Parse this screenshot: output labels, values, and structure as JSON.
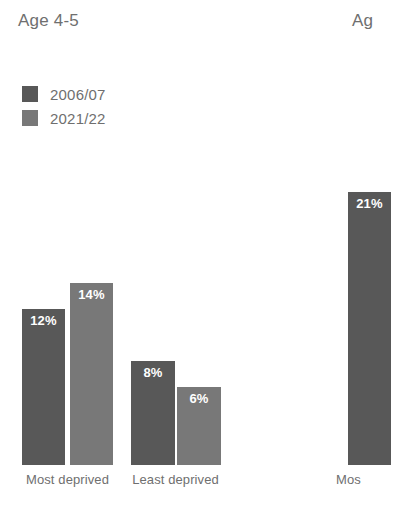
{
  "background_color": "#ffffff",
  "colors": {
    "series_2006": "#585858",
    "series_2021": "#787878",
    "text_gray": "#6f6f6f",
    "value_label": "#ffffff"
  },
  "panels": {
    "left": {
      "title": "Age 4-5",
      "legend": [
        {
          "label": "2006/07",
          "color": "#585858"
        },
        {
          "label": "2021/22",
          "color": "#787878"
        }
      ],
      "categories": [
        "Most deprived",
        "Least deprived"
      ],
      "bars": [
        {
          "category": "Most deprived",
          "series": "2006/07",
          "value": 12,
          "label": "12%"
        },
        {
          "category": "Most deprived",
          "series": "2021/22",
          "value": 14,
          "label": "14%"
        },
        {
          "category": "Least deprived",
          "series": "2006/07",
          "value": 8,
          "label": "8%"
        },
        {
          "category": "Least deprived",
          "series": "2021/22",
          "value": 6,
          "label": "6%"
        }
      ]
    },
    "right": {
      "title": "Ag",
      "categories": [
        "Mos"
      ],
      "bars": [
        {
          "category": "Mos",
          "series": "2006/07",
          "value": 21,
          "label": "21%"
        }
      ]
    }
  },
  "chart_data": [
    {
      "type": "bar",
      "title": "Age 4-5",
      "categories": [
        "Most deprived",
        "Least deprived"
      ],
      "series": [
        {
          "name": "2006/07",
          "values": [
            12,
            8
          ],
          "color": "#585858"
        },
        {
          "name": "2021/22",
          "values": [
            14,
            6
          ],
          "color": "#787878"
        }
      ],
      "data_labels": [
        "12%",
        "14%",
        "8%",
        "6%"
      ],
      "xlabel": "",
      "ylabel": "",
      "ylim": [
        0,
        22
      ],
      "grid": false,
      "legend_position": "top-left",
      "units": "percent"
    },
    {
      "type": "bar",
      "title": "Ag",
      "note": "second panel clipped at right edge of image",
      "categories": [
        "Mos"
      ],
      "series": [
        {
          "name": "2006/07",
          "values": [
            21
          ],
          "color": "#585858"
        }
      ],
      "data_labels": [
        "21%"
      ],
      "xlabel": "",
      "ylabel": "",
      "ylim": [
        0,
        22
      ],
      "grid": false,
      "units": "percent"
    }
  ]
}
